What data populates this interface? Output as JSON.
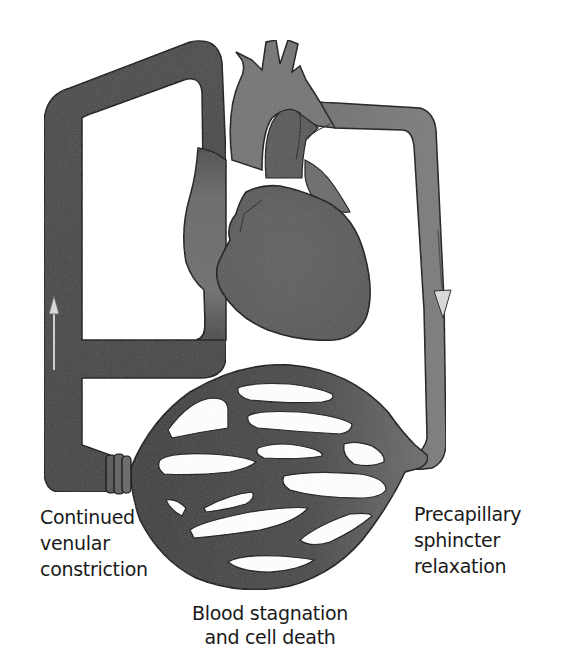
{
  "figure": {
    "type": "medical-illustration",
    "colors": {
      "venous_vessel": "#4a4a4a",
      "arterial_vessel": "#7a7a7a",
      "heart_dark": "#5c5c5c",
      "heart_light": "#7e7e7e",
      "outline": "#111111",
      "arrow_fill": "#d8d8d8",
      "background": "#ffffff"
    },
    "icons": {
      "left_arrow": "arrow-up-icon",
      "right_arrow": "arrow-down-icon",
      "constriction": "constriction-rings-icon"
    }
  },
  "labels": {
    "venular": {
      "lines": [
        "Continued",
        "venular",
        "constriction"
      ]
    },
    "precapillary": {
      "lines": [
        "Precapillary",
        "sphincter",
        "relaxation"
      ]
    },
    "stagnation": {
      "lines": [
        "Blood stagnation",
        "and cell death"
      ]
    }
  }
}
